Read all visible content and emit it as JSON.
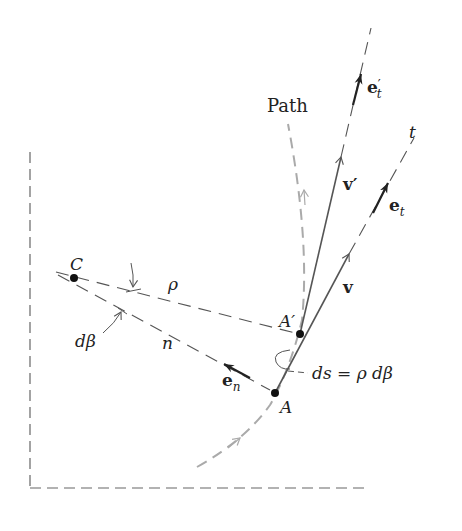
{
  "diagram": {
    "type": "kinematics-normal-tangential-coordinates",
    "colors": {
      "line": "#555555",
      "dark": "#222222",
      "path": "#aaaaaa",
      "frame": "#666666"
    },
    "points": {
      "C": {
        "label": "C",
        "x": 74,
        "y": 278
      },
      "A_prime": {
        "label": "A′",
        "x": 300,
        "y": 334
      },
      "A": {
        "label": "A",
        "x": 275,
        "y": 393
      }
    },
    "labels": {
      "path": "Path",
      "t_axis": "t",
      "rho": "ρ",
      "n_axis": "n",
      "d_beta": "dβ",
      "ds_eq": "ds = ρ dβ",
      "v": "v",
      "v_prime": "v′",
      "e_t_base": "e",
      "e_t_sub": "t",
      "e_t_prime_base": "e",
      "e_t_prime_prime": "′",
      "e_t_prime_sub": "t",
      "e_n_base": "e",
      "e_n_sub": "n"
    }
  }
}
